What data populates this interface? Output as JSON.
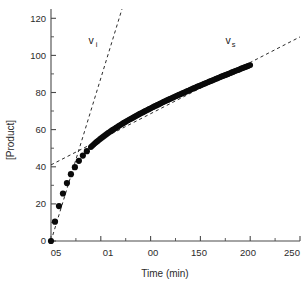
{
  "chart_data": {
    "type": "scatter",
    "title": "",
    "xlabel": "Time (min)",
    "ylabel": "[Product]",
    "xlim": [
      0,
      250
    ],
    "ylim": [
      0,
      125
    ],
    "grid": false,
    "legend": null,
    "x_ticks": [
      0,
      50,
      100,
      150,
      200,
      250
    ],
    "x_tick_labels": [
      "",
      "05",
      "01",
      "00",
      "150",
      "200",
      "250"
    ],
    "x_tick_labels_visible": [
      "05",
      "01",
      "00",
      "150",
      "200",
      "250"
    ],
    "x_minor_tick_step": 10,
    "y_ticks": [
      0,
      20,
      40,
      60,
      80,
      100,
      120
    ],
    "y_tick_labels": [
      "0",
      "20",
      "40",
      "60",
      "80",
      "100",
      "120"
    ],
    "y_minor_tick_step": 10,
    "marker": "filled-circle",
    "marker_color": "#0a0a0a",
    "series": [
      {
        "name": "product-progress-curve",
        "x": [
          0,
          4,
          8,
          12,
          16,
          20,
          24,
          28,
          32,
          36,
          40,
          44,
          48,
          52,
          56,
          60,
          64,
          68,
          72,
          76,
          80,
          84,
          88,
          92,
          96,
          100,
          104,
          108,
          112,
          116,
          120,
          124,
          128,
          132,
          136,
          140,
          144,
          148,
          152,
          156,
          160,
          164,
          168,
          172,
          176,
          180,
          184,
          188,
          192,
          196,
          200
        ],
        "y": [
          0,
          10.4,
          18.8,
          25.6,
          31.2,
          36.0,
          39.8,
          43.2,
          46.0,
          48.4,
          50.6,
          52.6,
          54.4,
          56.1,
          57.7,
          59.2,
          60.6,
          62.0,
          63.3,
          64.6,
          65.8,
          67.0,
          68.2,
          69.3,
          70.4,
          71.5,
          72.6,
          73.6,
          74.7,
          75.7,
          76.7,
          77.7,
          78.7,
          79.6,
          80.6,
          81.5,
          82.5,
          83.4,
          84.3,
          85.2,
          86.1,
          87.0,
          87.9,
          88.8,
          89.6,
          90.5,
          91.4,
          92.2,
          93.1,
          93.9,
          94.8
        ]
      }
    ],
    "dense_series_note": "steady-state branch drawn with closely-spaced overlapping markers",
    "reference_lines": [
      {
        "name": "initial-velocity-line",
        "label": "v",
        "label_subscript": "i",
        "style": "dashed",
        "x": [
          0,
          72
        ],
        "y": [
          0,
          125
        ],
        "slope": 1.74,
        "intercept": 0
      },
      {
        "name": "steady-state-velocity-line",
        "label": "v",
        "label_subscript": "s",
        "style": "dashed",
        "x": [
          0,
          250
        ],
        "y": [
          41,
          110
        ],
        "slope": 0.276,
        "intercept": 41
      }
    ],
    "annotations": [
      {
        "name": "vi-annotation",
        "text": "v",
        "subscript": "i",
        "x": 36,
        "y": 110
      },
      {
        "name": "vs-annotation",
        "text": "v",
        "subscript": "s",
        "x": 198,
        "y": 110
      }
    ]
  },
  "axes": {
    "y_title": "[Product]",
    "x_title": "Time (min)"
  }
}
